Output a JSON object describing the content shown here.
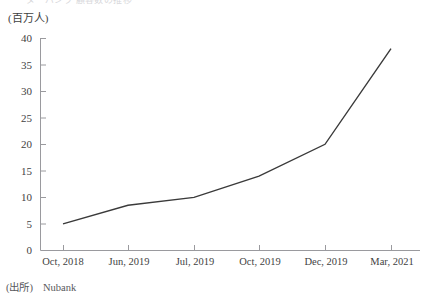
{
  "figure": {
    "title_faint": "ヌーバンク 顧客数の推移",
    "unit_label": "(百万人)",
    "source_label": "(出所)",
    "source_value": "Nubank"
  },
  "axis": {
    "y_ticks": [
      "0",
      "5",
      "10",
      "15",
      "20",
      "25",
      "30",
      "35",
      "40"
    ],
    "x_ticks": [
      "Oct, 2018",
      "Jun, 2019",
      "Jul,  2019",
      "Oct, 2019",
      "Dec, 2019",
      "Mar, 2021"
    ]
  },
  "style": {
    "line_color": "#3a3a3a",
    "axis_color": "#9a9a9e",
    "text_color": "#3f3f3f"
  },
  "chart_data": {
    "type": "line",
    "title": "ヌーバンク 顧客数の推移",
    "xlabel": "",
    "ylabel": "(百万人)",
    "categories": [
      "Oct, 2018",
      "Jun, 2019",
      "Jul,  2019",
      "Oct, 2019",
      "Dec, 2019",
      "Mar, 2021"
    ],
    "values": [
      5,
      8.5,
      10,
      14,
      20,
      38
    ],
    "ylim": [
      0,
      40
    ],
    "ytick_step": 5,
    "grid": false,
    "legend": false,
    "series": [
      {
        "name": "顧客数",
        "values": [
          5,
          8.5,
          10,
          14,
          20,
          38
        ]
      }
    ]
  }
}
